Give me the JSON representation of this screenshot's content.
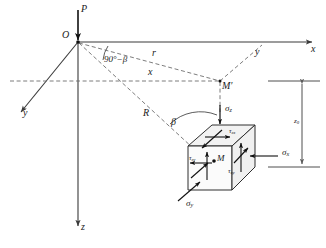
{
  "figure": {
    "type": "engineering-stress-diagram",
    "colors": {
      "solid_line": "#3a3a3a",
      "dashed_line": "#6e6e6e",
      "cube_face": "#f4f4f4",
      "text": "#1a1a1a"
    }
  },
  "labels": {
    "load": "P",
    "origin": "O",
    "axis_x": "x",
    "axis_y_right": "y",
    "axis_y_left": "y",
    "axis_z": "z",
    "angle_complement": "90°−β",
    "angle_beta": "β",
    "radius_r": "r",
    "distance_x": "x",
    "radius_R": "R",
    "point_M_prime": "M′",
    "point_M": "M",
    "depth": "z",
    "depth_sub": "0"
  },
  "stresses": {
    "sigma_z": {
      "symbol": "σ",
      "sub": "z"
    },
    "sigma_x": {
      "symbol": "σ",
      "sub": "x"
    },
    "sigma_y": {
      "symbol": "σ",
      "sub": "y"
    },
    "tau_zx": {
      "symbol": "τ",
      "sub": "zx"
    },
    "tau_zy": {
      "symbol": "τ",
      "sub": "zy"
    },
    "tau_xy": {
      "symbol": "τ",
      "sub": "xy"
    }
  },
  "icons": {
    "arrow_head": "arrowhead-icon",
    "load_arrow": "downward-load-arrow-icon",
    "dimension_marker": "dimension-line-icon"
  }
}
